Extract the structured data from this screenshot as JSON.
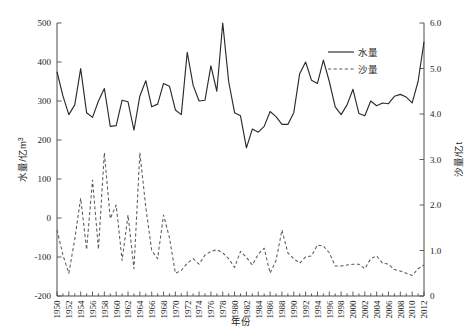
{
  "chart_data": {
    "type": "line",
    "title": "",
    "xlabel": "年份",
    "ylabel": "水量/亿m³",
    "y2label": "沙量/亿t",
    "ylim": [
      -200,
      500
    ],
    "y2lim": [
      0,
      6.0
    ],
    "xlim": [
      1950,
      2012
    ],
    "grid": false,
    "legend_position": "upper-right-inside",
    "yticks": [
      500,
      400,
      300,
      200,
      100,
      0,
      -100,
      -200
    ],
    "ytick_labels": [
      "500",
      "400",
      "300",
      "200",
      "100",
      "0",
      "-100",
      "-200"
    ],
    "y2ticks": [
      6.0,
      5.0,
      4.0,
      3.0,
      2.0,
      1.0,
      0
    ],
    "y2tick_labels": [
      "6.0",
      "5.0",
      "4.0",
      "3.0",
      "2.0",
      "1.0",
      "0"
    ],
    "xtick_labels": [
      "1950",
      "1952",
      "1954",
      "1956",
      "1958",
      "1960",
      "1962",
      "1964",
      "1966",
      "1968",
      "1970",
      "1972",
      "1974",
      "1976",
      "1978",
      "1980",
      "1982",
      "1984",
      "1986",
      "1988",
      "1990",
      "1992",
      "1994",
      "1996",
      "1998",
      "2000",
      "2002",
      "2004",
      "2006",
      "2008",
      "2010",
      "2012"
    ],
    "x": [
      1950,
      1951,
      1952,
      1953,
      1954,
      1955,
      1956,
      1957,
      1958,
      1959,
      1960,
      1961,
      1962,
      1963,
      1964,
      1965,
      1966,
      1967,
      1968,
      1969,
      1970,
      1971,
      1972,
      1973,
      1974,
      1975,
      1976,
      1977,
      1978,
      1979,
      1980,
      1981,
      1982,
      1983,
      1984,
      1985,
      1986,
      1987,
      1988,
      1989,
      1990,
      1991,
      1992,
      1993,
      1994,
      1995,
      1996,
      1997,
      1998,
      1999,
      2000,
      2001,
      2002,
      2003,
      2004,
      2005,
      2006,
      2007,
      2008,
      2009,
      2010,
      2011,
      2012
    ],
    "series": [
      {
        "name": "水量",
        "axis": "left",
        "style": "solid",
        "color": "#2b2b2b",
        "unit": "亿m³",
        "values": [
          375,
          313,
          265,
          290,
          383,
          270,
          258,
          300,
          332,
          235,
          237,
          302,
          298,
          225,
          313,
          352,
          285,
          292,
          345,
          338,
          277,
          265,
          425,
          340,
          300,
          302,
          390,
          325,
          500,
          350,
          270,
          262,
          180,
          228,
          220,
          235,
          273,
          260,
          240,
          240,
          270,
          370,
          400,
          353,
          345,
          405,
          350,
          285,
          265,
          290,
          330,
          268,
          262,
          300,
          288,
          295,
          293,
          312,
          317,
          310,
          295,
          350,
          452
        ]
      },
      {
        "name": "沙量",
        "axis": "right",
        "style": "dashed",
        "color": "#5a5a5a",
        "unit": "亿t",
        "values": [
          1.45,
          0.9,
          0.5,
          1.25,
          2.15,
          1.02,
          2.55,
          1.03,
          3.15,
          1.7,
          2.0,
          0.78,
          1.78,
          0.6,
          3.15,
          1.95,
          1.0,
          0.82,
          1.78,
          1.28,
          0.5,
          0.56,
          0.72,
          0.82,
          0.7,
          0.9,
          0.98,
          1.02,
          0.95,
          0.82,
          0.63,
          0.98,
          0.85,
          0.68,
          0.92,
          1.05,
          0.5,
          0.78,
          1.45,
          0.95,
          0.82,
          0.72,
          0.86,
          0.88,
          1.12,
          1.1,
          0.95,
          0.66,
          0.66,
          0.68,
          0.7,
          0.7,
          0.6,
          0.82,
          0.88,
          0.72,
          0.7,
          0.58,
          0.55,
          0.5,
          0.45,
          0.6,
          0.68
        ]
      }
    ]
  },
  "legend": {
    "items": [
      {
        "label": "水量",
        "style": "solid"
      },
      {
        "label": "沙量",
        "style": "dashed"
      }
    ]
  }
}
